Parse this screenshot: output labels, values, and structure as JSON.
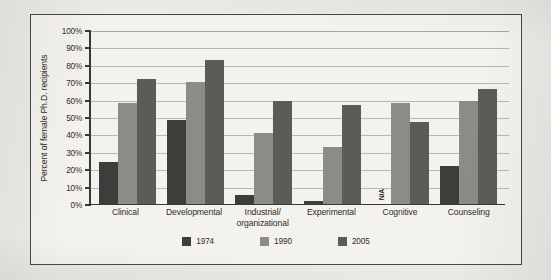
{
  "chart_data": {
    "type": "bar",
    "title": "",
    "xlabel": "",
    "ylabel": "Percent of female Ph.D. recipients",
    "ylim": [
      0,
      100
    ],
    "ytick_labels": [
      "100%",
      "90%",
      "80%",
      "70%",
      "60%",
      "50%",
      "40%",
      "30%",
      "20%",
      "10%",
      "0%"
    ],
    "ytick_values": [
      100,
      90,
      80,
      70,
      60,
      50,
      40,
      30,
      20,
      10,
      0
    ],
    "grid": true,
    "legend_position": "bottom",
    "categories": [
      "Clinical",
      "Developmental",
      "Industrial/ organizational",
      "Experimental",
      "Cognitive",
      "Counseling"
    ],
    "series": [
      {
        "name": "1974",
        "color": "#3f3d3b",
        "values": [
          24,
          48,
          5,
          1.5,
          null,
          22
        ],
        "value_labels": [
          "24",
          "48",
          "5",
          "1.5",
          "N/A",
          "22"
        ]
      },
      {
        "name": "1990",
        "color": "#8d8b88",
        "values": [
          58,
          70,
          41,
          33,
          58,
          59
        ],
        "value_labels": [
          "58",
          "70",
          "41",
          "33",
          "58",
          "59"
        ]
      },
      {
        "name": "2005",
        "color": "#5d5b58",
        "values": [
          72,
          83,
          59,
          57,
          47,
          66
        ],
        "value_labels": [
          "72",
          "83",
          "59",
          "57",
          "47",
          "66"
        ]
      }
    ],
    "missing_label": "N/A",
    "missing_cells": [
      {
        "series": "1974",
        "category": "Cognitive"
      }
    ]
  },
  "colors": {
    "page_background": "#eceae5",
    "figure_background": "#f4f2ee",
    "frame_border": "#4a4845",
    "axis": "#3a3835",
    "gridline": "#b9b7b2",
    "text": "#2e2c29"
  }
}
